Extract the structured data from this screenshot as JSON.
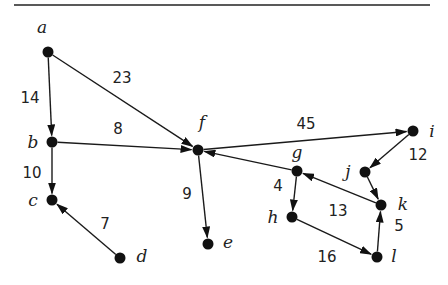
{
  "diagram": {
    "type": "weighted-directed-graph",
    "nodes": [
      {
        "id": "a",
        "label": "a",
        "x": 48,
        "y": 52,
        "lx": 42,
        "ly": 33,
        "anchor": "middle"
      },
      {
        "id": "b",
        "label": "b",
        "x": 52,
        "y": 142,
        "lx": 33,
        "ly": 148,
        "anchor": "middle"
      },
      {
        "id": "c",
        "label": "c",
        "x": 52,
        "y": 200,
        "lx": 33,
        "ly": 206,
        "anchor": "middle"
      },
      {
        "id": "d",
        "label": "d",
        "x": 120,
        "y": 258,
        "lx": 142,
        "ly": 262,
        "anchor": "middle"
      },
      {
        "id": "e",
        "label": "e",
        "x": 208,
        "y": 244,
        "lx": 228,
        "ly": 248,
        "anchor": "middle"
      },
      {
        "id": "f",
        "label": "f",
        "x": 198,
        "y": 150,
        "lx": 202,
        "ly": 128,
        "anchor": "middle"
      },
      {
        "id": "g",
        "label": "g",
        "x": 297,
        "y": 171,
        "lx": 297,
        "ly": 158,
        "anchor": "middle"
      },
      {
        "id": "h",
        "label": "h",
        "x": 292,
        "y": 217,
        "lx": 273,
        "ly": 223,
        "anchor": "middle"
      },
      {
        "id": "i",
        "label": "i",
        "x": 413,
        "y": 131,
        "lx": 432,
        "ly": 137,
        "anchor": "middle"
      },
      {
        "id": "j",
        "label": "j",
        "x": 365,
        "y": 172,
        "lx": 348,
        "ly": 177,
        "anchor": "middle"
      },
      {
        "id": "k",
        "label": "k",
        "x": 381,
        "y": 205,
        "lx": 403,
        "ly": 210,
        "anchor": "middle"
      },
      {
        "id": "l",
        "label": "l",
        "x": 377,
        "y": 257,
        "lx": 394,
        "ly": 262,
        "anchor": "middle"
      }
    ],
    "edges": [
      {
        "from": "a",
        "to": "b",
        "weight": "14",
        "lx": 30,
        "ly": 103
      },
      {
        "from": "a",
        "to": "f",
        "weight": "23",
        "lx": 122,
        "ly": 83
      },
      {
        "from": "b",
        "to": "f",
        "weight": "8",
        "lx": 118,
        "ly": 134
      },
      {
        "from": "b",
        "to": "c",
        "weight": "10",
        "lx": 32,
        "ly": 178
      },
      {
        "from": "d",
        "to": "c",
        "weight": "7",
        "lx": 105,
        "ly": 229
      },
      {
        "from": "f",
        "to": "e",
        "weight": "9",
        "lx": 187,
        "ly": 199
      },
      {
        "from": "f",
        "to": "i",
        "weight": "45",
        "lx": 306,
        "ly": 129
      },
      {
        "from": "g",
        "to": "f",
        "weight": "",
        "lx": 0,
        "ly": 0
      },
      {
        "from": "g",
        "to": "h",
        "weight": "4",
        "lx": 278,
        "ly": 191
      },
      {
        "from": "h",
        "to": "l",
        "weight": "16",
        "lx": 327,
        "ly": 262
      },
      {
        "from": "l",
        "to": "k",
        "weight": "5",
        "lx": 399,
        "ly": 231
      },
      {
        "from": "k",
        "to": "g",
        "weight": "13",
        "lx": 338,
        "ly": 216
      },
      {
        "from": "i",
        "to": "j",
        "weight": "12",
        "lx": 418,
        "ly": 160
      },
      {
        "from": "j",
        "to": "k",
        "weight": "",
        "lx": 0,
        "ly": 0
      }
    ],
    "colors": {
      "ink": "#111111",
      "background": "#ffffff"
    }
  }
}
